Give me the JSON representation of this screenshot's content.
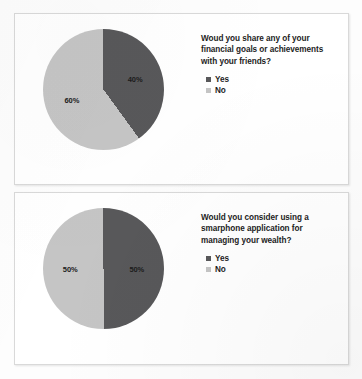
{
  "colors": {
    "yes": "#58585a",
    "no": "#c5c5c5",
    "panel_border": "#d9d9d9",
    "page_background": "#fdfdfd",
    "text": "#1d1d1d"
  },
  "panels": [
    {
      "question": "Woud you share any of your financial goals or achievements with your friends?",
      "legend": [
        {
          "label": "Yes",
          "color_key": "yes"
        },
        {
          "label": "No",
          "color_key": "no"
        }
      ],
      "labels": {
        "yes": "40%",
        "no": "60%"
      }
    },
    {
      "question": "Would you consider using a smarphone application for managing your wealth?",
      "legend": [
        {
          "label": "Yes",
          "color_key": "yes"
        },
        {
          "label": "No",
          "color_key": "no"
        }
      ],
      "labels": {
        "yes": "50%",
        "no": "50%"
      }
    }
  ],
  "chart_data": [
    {
      "type": "pie",
      "title": "Woud you share any of your financial goals or achievements with your friends?",
      "categories": [
        "Yes",
        "No"
      ],
      "values": [
        40,
        60
      ],
      "value_labels": [
        "40%",
        "60%"
      ],
      "unit": "percent",
      "colors": [
        "#58585a",
        "#c5c5c5"
      ],
      "legend_position": "right",
      "start_angle_deg": 0,
      "direction": "clockwise",
      "grid": false
    },
    {
      "type": "pie",
      "title": "Would you consider using a smarphone application for managing your wealth?",
      "categories": [
        "Yes",
        "No"
      ],
      "values": [
        50,
        50
      ],
      "value_labels": [
        "50%",
        "50%"
      ],
      "unit": "percent",
      "colors": [
        "#58585a",
        "#c5c5c5"
      ],
      "legend_position": "right",
      "start_angle_deg": 0,
      "direction": "clockwise",
      "grid": false
    }
  ]
}
